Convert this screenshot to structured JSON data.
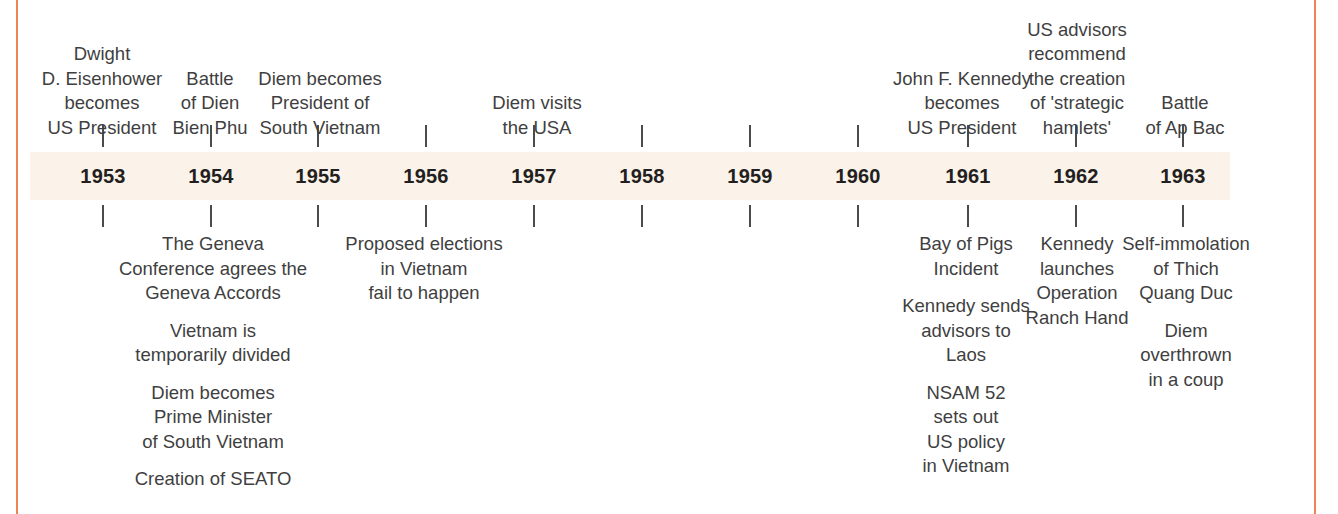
{
  "figure": {
    "type": "timeline",
    "colors": {
      "band": "#fbf2e9",
      "rule": "#ee8258",
      "text": "#3f3f3f",
      "year_text": "#231f20",
      "tick": "#4b4b4b"
    }
  },
  "chart_data": {
    "type": "table",
    "categories": [
      "1953",
      "1954",
      "1955",
      "1956",
      "1957",
      "1958",
      "1959",
      "1960",
      "1961",
      "1962",
      "1963"
    ],
    "axis_years": [
      1953,
      1963
    ]
  },
  "years": [
    {
      "label": "1953",
      "x": 102
    },
    {
      "label": "1954",
      "x": 210
    },
    {
      "label": "1955",
      "x": 317
    },
    {
      "label": "1956",
      "x": 425
    },
    {
      "label": "1957",
      "x": 533
    },
    {
      "label": "1958",
      "x": 641
    },
    {
      "label": "1959",
      "x": 749
    },
    {
      "label": "1960",
      "x": 857
    },
    {
      "label": "1961",
      "x": 967
    },
    {
      "label": "1962",
      "x": 1075
    },
    {
      "label": "1963",
      "x": 1182
    }
  ],
  "events_above": [
    {
      "year": "1953",
      "x": 102,
      "width": 180,
      "blocks": [
        [
          "Dwight",
          "D. Eisenhower",
          "becomes",
          "US President"
        ]
      ]
    },
    {
      "year": "1954",
      "x": 210,
      "width": 110,
      "blocks": [
        [
          "Battle",
          "of Dien",
          "Bien Phu"
        ]
      ]
    },
    {
      "year": "1955",
      "x": 320,
      "width": 170,
      "blocks": [
        [
          "Diem becomes",
          "President of",
          "South Vietnam"
        ]
      ]
    },
    {
      "year": "1957",
      "x": 537,
      "width": 140,
      "blocks": [
        [
          "Diem visits",
          "the USA"
        ]
      ]
    },
    {
      "year": "1961",
      "x": 962,
      "width": 180,
      "blocks": [
        [
          "John F. Kennedy",
          "becomes",
          "US President"
        ]
      ]
    },
    {
      "year": "1962",
      "x": 1077,
      "width": 140,
      "blocks": [
        [
          "US advisors",
          "recommend",
          "the creation",
          "of 'strategic",
          "hamlets'"
        ]
      ]
    },
    {
      "year": "1963",
      "x": 1185,
      "width": 120,
      "blocks": [
        [
          "Battle",
          "of Ap Bac"
        ]
      ]
    }
  ],
  "events_below": [
    {
      "year": "1954",
      "x": 213,
      "width": 215,
      "blocks": [
        [
          "The Geneva",
          "Conference agrees the",
          "Geneva Accords"
        ],
        [
          "Vietnam is",
          "temporarily divided"
        ],
        [
          "Diem becomes",
          "Prime Minister",
          "of South Vietnam"
        ],
        [
          "Creation of SEATO"
        ]
      ]
    },
    {
      "year": "1956",
      "x": 424,
      "width": 180,
      "blocks": [
        [
          "Proposed elections",
          "in Vietnam",
          "fail to happen"
        ]
      ]
    },
    {
      "year": "1961",
      "x": 966,
      "width": 150,
      "blocks": [
        [
          "Bay of Pigs",
          "Incident"
        ],
        [
          "Kennedy sends",
          "advisors to",
          "Laos"
        ],
        [
          "NSAM 52",
          "sets out",
          "US policy",
          "in Vietnam"
        ]
      ]
    },
    {
      "year": "1962",
      "x": 1077,
      "width": 130,
      "blocks": [
        [
          "Kennedy",
          "launches",
          "Operation",
          "Ranch Hand"
        ]
      ]
    },
    {
      "year": "1963",
      "x": 1186,
      "width": 150,
      "blocks": [
        [
          "Self-immolation",
          "of Thich",
          "Quang Duc"
        ],
        [
          "Diem",
          "overthrown",
          "in a coup"
        ]
      ]
    }
  ]
}
